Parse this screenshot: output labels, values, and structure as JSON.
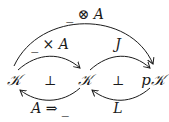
{
  "diagram": {
    "type": "commutative-diagram-adjunctions",
    "nodes": [
      {
        "id": "K1",
        "label": "𝒦"
      },
      {
        "id": "K2",
        "label": "𝒦"
      },
      {
        "id": "pK",
        "label": "p𝒦"
      }
    ],
    "arrows": [
      {
        "from": "K1",
        "to": "pK",
        "label": "_ ⊗ A"
      },
      {
        "from": "K1",
        "to": "K2",
        "label": "_ × A"
      },
      {
        "from": "K2",
        "to": "K1",
        "label": "A ⇒ _"
      },
      {
        "from": "K2",
        "to": "pK",
        "label": "J"
      },
      {
        "from": "pK",
        "to": "K2",
        "label": "L"
      }
    ],
    "adjunction_symbols": [
      "⊥",
      "⊥"
    ],
    "stroke_color": "#1a1a1a"
  }
}
